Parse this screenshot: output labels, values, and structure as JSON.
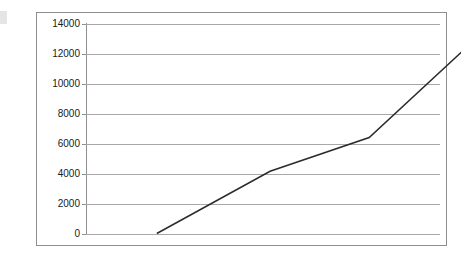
{
  "chart_data": {
    "type": "line",
    "title": "",
    "subtitle": "",
    "xlabel": "",
    "ylabel": "",
    "grid": true,
    "legend": false,
    "legend_position": "none",
    "xlim": [
      0,
      5
    ],
    "ylim": [
      0,
      14000
    ],
    "y_ticks": [
      0,
      2000,
      4000,
      6000,
      8000,
      10000,
      12000,
      14000
    ],
    "y_tick_labels": [
      "0",
      "2000",
      "4000",
      "6000",
      "8000",
      "10000",
      "12000",
      "14000"
    ],
    "x_ticks": [],
    "x_tick_labels": [],
    "series": [
      {
        "name": "",
        "color": "#2b2b2b",
        "line_width": 1.5,
        "markers": false,
        "x": [
          1.0,
          2.6,
          4.0,
          5.35
        ],
        "values": [
          0,
          4150,
          6400,
          12300
        ]
      }
    ]
  },
  "axis": {
    "y_labels": [
      "14000",
      "12000",
      "10000",
      "8000",
      "6000",
      "4000",
      "2000",
      "0"
    ]
  }
}
